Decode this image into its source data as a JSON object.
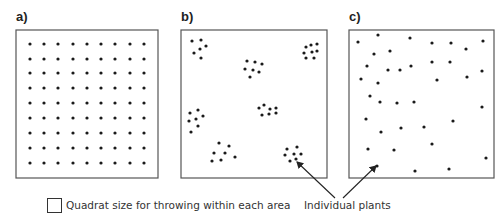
{
  "panels": [
    {
      "label": "a)",
      "pattern": "uniform",
      "box": {
        "x": 16,
        "y": 30,
        "w": 142,
        "h": 148
      },
      "grid": {
        "cols_x": [
          30,
          44,
          58,
          73,
          87,
          101,
          115,
          130,
          144
        ],
        "rows_y": [
          44,
          59,
          73,
          88,
          103,
          118,
          133,
          148,
          163
        ]
      }
    },
    {
      "label": "b)",
      "pattern": "clumped",
      "box": {
        "x": 181,
        "y": 30,
        "w": 146,
        "h": 148
      },
      "dots": [
        [
          192,
          41
        ],
        [
          201,
          40
        ],
        [
          206,
          46
        ],
        [
          194,
          53
        ],
        [
          200,
          49
        ],
        [
          201,
          58
        ],
        [
          247,
          61
        ],
        [
          255,
          62
        ],
        [
          262,
          64
        ],
        [
          245,
          69
        ],
        [
          253,
          70
        ],
        [
          259,
          72
        ],
        [
          250,
          77
        ],
        [
          306,
          47
        ],
        [
          311,
          45
        ],
        [
          317,
          44
        ],
        [
          304,
          53
        ],
        [
          312,
          52
        ],
        [
          317,
          51
        ],
        [
          306,
          58
        ],
        [
          314,
          58
        ],
        [
          190,
          113
        ],
        [
          198,
          110
        ],
        [
          203,
          116
        ],
        [
          189,
          121
        ],
        [
          196,
          119
        ],
        [
          198,
          126
        ],
        [
          191,
          132
        ],
        [
          259,
          108
        ],
        [
          264,
          105
        ],
        [
          270,
          109
        ],
        [
          276,
          108
        ],
        [
          262,
          115
        ],
        [
          269,
          114
        ],
        [
          276,
          113
        ],
        [
          219,
          143
        ],
        [
          229,
          146
        ],
        [
          214,
          153
        ],
        [
          225,
          153
        ],
        [
          235,
          157
        ],
        [
          212,
          161
        ],
        [
          221,
          160
        ],
        [
          287,
          149
        ],
        [
          297,
          147
        ],
        [
          285,
          155
        ],
        [
          294,
          154
        ],
        [
          301,
          154
        ],
        [
          290,
          161
        ],
        [
          296,
          159
        ]
      ]
    },
    {
      "label": "c)",
      "pattern": "random",
      "box": {
        "x": 349,
        "y": 30,
        "w": 145,
        "h": 148
      },
      "dots": [
        [
          358,
          42
        ],
        [
          378,
          35
        ],
        [
          410,
          38
        ],
        [
          374,
          54
        ],
        [
          390,
          51
        ],
        [
          367,
          66
        ],
        [
          388,
          70
        ],
        [
          400,
          70
        ],
        [
          411,
          66
        ],
        [
          361,
          79
        ],
        [
          378,
          83
        ],
        [
          432,
          43
        ],
        [
          451,
          43
        ],
        [
          466,
          49
        ],
        [
          483,
          41
        ],
        [
          432,
          62
        ],
        [
          450,
          62
        ],
        [
          467,
          77
        ],
        [
          482,
          71
        ],
        [
          437,
          80
        ],
        [
          370,
          96
        ],
        [
          380,
          102
        ],
        [
          397,
          103
        ],
        [
          414,
          102
        ],
        [
          482,
          107
        ],
        [
          366,
          119
        ],
        [
          453,
          121
        ],
        [
          381,
          132
        ],
        [
          401,
          128
        ],
        [
          424,
          127
        ],
        [
          368,
          149
        ],
        [
          394,
          150
        ],
        [
          432,
          144
        ],
        [
          486,
          158
        ],
        [
          377,
          166
        ],
        [
          415,
          171
        ],
        [
          449,
          169
        ]
      ]
    }
  ],
  "legend": {
    "quadrat_label": "Quadrat size for throwing within each area",
    "plants_label": "Individual plants"
  },
  "arrows": [
    {
      "from": [
        335,
        198
      ],
      "to": [
        297,
        162
      ]
    },
    {
      "from": [
        343,
        198
      ],
      "to": [
        376,
        166
      ]
    }
  ],
  "colors": {
    "stroke": "#555555",
    "dot": "#1a1a1a",
    "arrow": "#222222"
  }
}
